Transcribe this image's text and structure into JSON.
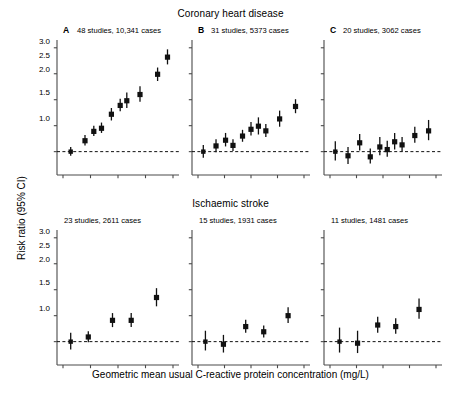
{
  "figure": {
    "y_axis_label": "Risk ratio (95% CI)",
    "x_axis_label": "Geometric mean usual C-reactive protein concentration (mg/L)",
    "y_ticks": [
      "1.0",
      "1.5",
      "2.0",
      "2.5",
      "3.0"
    ],
    "reference_line_value": 1.0
  },
  "rows": [
    {
      "title": "Coronary heart disease"
    },
    {
      "title": "Ischaemic stroke"
    }
  ],
  "panels": [
    {
      "letter": "A",
      "caption": "48 studies, 10,341 cases"
    },
    {
      "letter": "B",
      "caption": "31 studies, 5373 cases"
    },
    {
      "letter": "C",
      "caption": "20 studies, 3062 cases"
    },
    {
      "letter": "",
      "caption": "23 studies, 2611 cases"
    },
    {
      "letter": "",
      "caption": "15 studies, 1931 cases"
    },
    {
      "letter": "",
      "caption": "11 studies, 1481 cases"
    }
  ],
  "chart_data": {
    "type": "scatter",
    "ylabel": "Risk ratio (95% CI)",
    "xlabel": "Geometric mean usual C-reactive protein concentration (mg/L)",
    "ylim": [
      0.55,
      3.15
    ],
    "yticks": [
      1.0,
      1.5,
      2.0,
      2.5,
      3.0
    ],
    "xlim": [
      0,
      1
    ],
    "grid": false,
    "legend": "none",
    "reference_line": 1.0,
    "marker": "filled-square-with-vertical-ci-bars",
    "panels": [
      {
        "id": "A",
        "row": "Coronary heart disease",
        "letter": "A",
        "caption": "48 studies, 10,341 cases",
        "n_studies": 48,
        "n_cases": 10341,
        "n_points": 9,
        "x": [
          0.07,
          0.2,
          0.28,
          0.35,
          0.44,
          0.52,
          0.58,
          0.7,
          0.86
        ],
        "values": [
          1.0,
          1.21,
          1.39,
          1.45,
          1.72,
          1.89,
          1.98,
          2.1,
          2.49
        ],
        "ci_low": [
          0.92,
          1.12,
          1.3,
          1.36,
          1.6,
          1.78,
          1.84,
          1.96,
          2.36
        ],
        "ci_high": [
          1.09,
          1.32,
          1.5,
          1.56,
          1.84,
          2.02,
          2.14,
          2.26,
          2.62
        ],
        "last_point": {
          "x": 0.95,
          "value": 2.82,
          "ci_low": 2.68,
          "ci_high": 2.97
        }
      },
      {
        "id": "B",
        "row": "Coronary heart disease",
        "letter": "B",
        "caption": "31 studies, 5373 cases",
        "n_studies": 31,
        "n_cases": 5373,
        "n_points": 10,
        "x": [
          0.05,
          0.17,
          0.26,
          0.33,
          0.42,
          0.5,
          0.57,
          0.64,
          0.77,
          0.92
        ],
        "values": [
          1.0,
          1.11,
          1.22,
          1.12,
          1.3,
          1.43,
          1.49,
          1.4,
          1.63,
          1.87
        ],
        "ci_low": [
          0.88,
          0.99,
          1.1,
          1.01,
          1.19,
          1.31,
          1.33,
          1.28,
          1.48,
          1.74
        ],
        "ci_high": [
          1.13,
          1.24,
          1.36,
          1.24,
          1.42,
          1.57,
          1.66,
          1.53,
          1.79,
          2.01
        ]
      },
      {
        "id": "C",
        "row": "Coronary heart disease",
        "letter": "C",
        "caption": "20 studies, 3062 cases",
        "n_studies": 20,
        "n_cases": 3062,
        "n_points": 10,
        "x": [
          0.05,
          0.17,
          0.28,
          0.38,
          0.47,
          0.54,
          0.61,
          0.68,
          0.8,
          0.93
        ],
        "values": [
          1.0,
          0.92,
          1.17,
          0.9,
          1.09,
          1.04,
          1.19,
          1.13,
          1.31,
          1.4
        ],
        "ci_low": [
          0.83,
          0.76,
          1.02,
          0.77,
          0.93,
          0.9,
          1.04,
          1.0,
          1.17,
          1.22
        ],
        "ci_high": [
          1.2,
          1.09,
          1.34,
          1.06,
          1.28,
          1.21,
          1.36,
          1.28,
          1.48,
          1.61
        ]
      },
      {
        "id": "D",
        "row": "Ischaemic stroke",
        "letter": "",
        "caption": "23 studies, 2611 cases",
        "n_studies": 23,
        "n_cases": 2611,
        "n_points": 5,
        "x": [
          0.07,
          0.23,
          0.45,
          0.62,
          0.85
        ],
        "values": [
          1.0,
          1.09,
          1.41,
          1.41,
          1.85
        ],
        "ci_low": [
          0.85,
          0.99,
          1.28,
          1.28,
          1.68
        ],
        "ci_high": [
          1.17,
          1.2,
          1.55,
          1.55,
          2.03
        ]
      },
      {
        "id": "E",
        "row": "Ischaemic stroke",
        "letter": "",
        "caption": "15 studies, 1931 cases",
        "n_studies": 15,
        "n_cases": 1931,
        "n_points": 5,
        "x": [
          0.07,
          0.24,
          0.45,
          0.62,
          0.85
        ],
        "values": [
          1.0,
          0.95,
          1.29,
          1.19,
          1.5
        ],
        "ci_low": [
          0.83,
          0.79,
          1.17,
          1.08,
          1.36
        ],
        "ci_high": [
          1.21,
          1.13,
          1.42,
          1.31,
          1.66
        ]
      },
      {
        "id": "F",
        "row": "Ischaemic stroke",
        "letter": "",
        "caption": "11 studies, 1481 cases",
        "n_studies": 11,
        "n_cases": 1481,
        "n_points": 5,
        "x": [
          0.09,
          0.26,
          0.45,
          0.62,
          0.84
        ],
        "values": [
          1.0,
          0.97,
          1.32,
          1.29,
          1.62
        ],
        "ci_low": [
          0.79,
          0.78,
          1.17,
          1.15,
          1.44
        ],
        "ci_high": [
          1.27,
          1.21,
          1.48,
          1.45,
          1.83
        ]
      }
    ]
  }
}
